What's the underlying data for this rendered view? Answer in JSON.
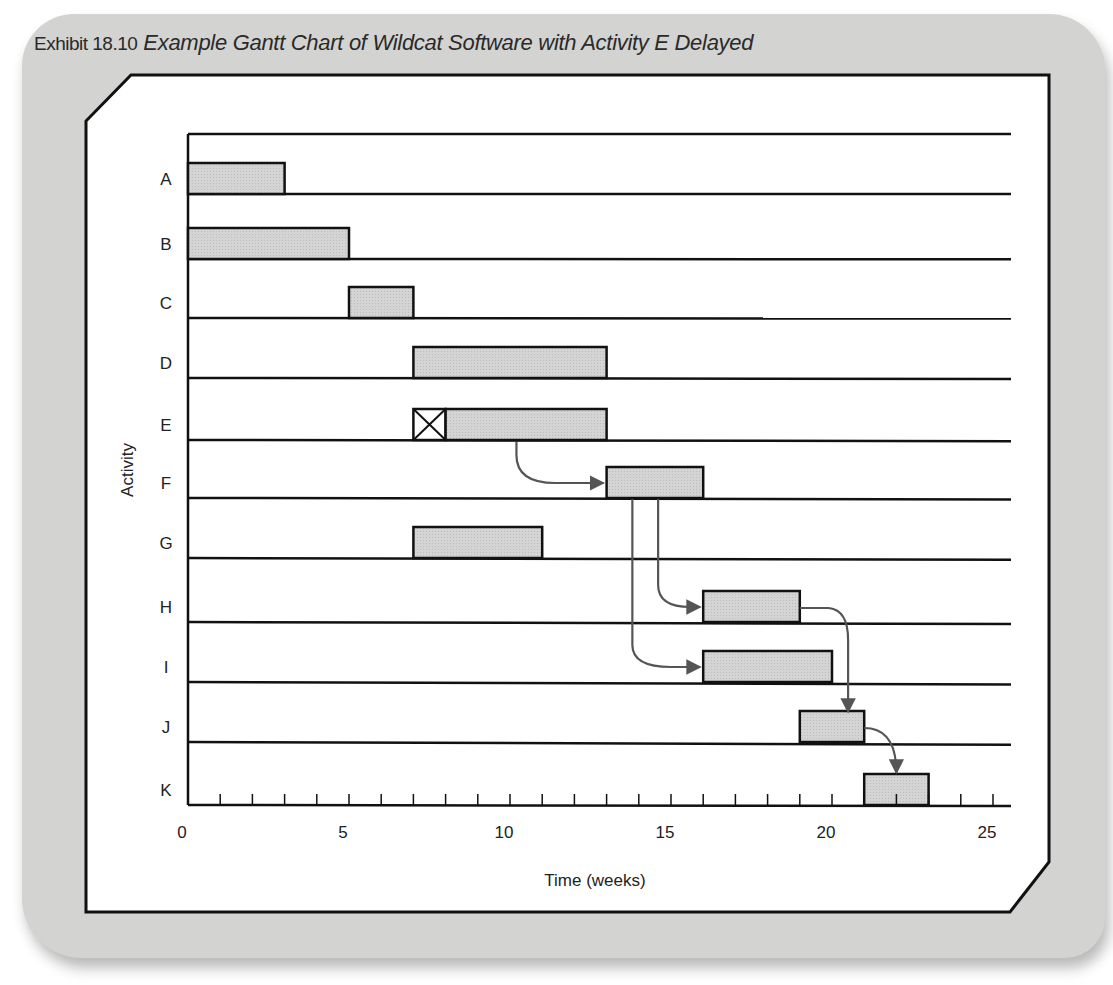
{
  "exhibit": {
    "number": "Exhibit 18.10",
    "title": "Example Gantt Chart of Wildcat Software with Activity E Delayed"
  },
  "chart_data": {
    "type": "gantt",
    "title": "Example Gantt Chart of Wildcat Software with Activity E Delayed",
    "xlabel": "Time (weeks)",
    "ylabel": "Activity",
    "xlim": [
      0,
      25
    ],
    "x_ticks": [
      0,
      5,
      10,
      15,
      20,
      25
    ],
    "minor_tick_step": 1,
    "grid": "horizontal row lines",
    "legend": null,
    "activities": [
      {
        "name": "A",
        "start": 0,
        "end": 3
      },
      {
        "name": "B",
        "start": 0,
        "end": 5
      },
      {
        "name": "C",
        "start": 5,
        "end": 7
      },
      {
        "name": "D",
        "start": 7,
        "end": 13
      },
      {
        "name": "E",
        "start": 8,
        "end": 13,
        "delay": {
          "start": 7,
          "end": 8,
          "marker": "boxed-X"
        }
      },
      {
        "name": "F",
        "start": 13,
        "end": 16
      },
      {
        "name": "G",
        "start": 7,
        "end": 11
      },
      {
        "name": "H",
        "start": 16,
        "end": 19
      },
      {
        "name": "I",
        "start": 16,
        "end": 20
      },
      {
        "name": "J",
        "start": 19,
        "end": 21
      },
      {
        "name": "K",
        "start": 21,
        "end": 23
      }
    ],
    "dependency_arrows": [
      {
        "from": "E",
        "to": "F"
      },
      {
        "from": "F",
        "to": "H"
      },
      {
        "from": "F",
        "to": "I"
      },
      {
        "from": "H",
        "to": "J"
      },
      {
        "from": "J",
        "to": "K"
      }
    ]
  },
  "colors": {
    "card": "#d3d3d1",
    "bar_fill": "#cfcfcf",
    "line": "#111111",
    "arrow": "#555555"
  }
}
